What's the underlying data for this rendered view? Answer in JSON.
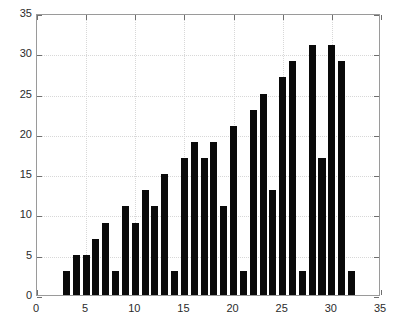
{
  "chart_data": {
    "type": "bar",
    "title": "",
    "subtitle": "",
    "xlabel": "",
    "ylabel": "",
    "grid": true,
    "legend": null,
    "legend_position": "none",
    "bar_color": "#0a0a0a",
    "axis_color": "#9a9a9a",
    "grid_color": "#d8d8d8",
    "background": "#ffffff",
    "xlim": [
      0,
      35
    ],
    "ylim": [
      0,
      35
    ],
    "xticks": [
      0,
      5,
      10,
      15,
      20,
      25,
      30,
      35
    ],
    "yticks": [
      0,
      5,
      10,
      15,
      20,
      25,
      30,
      35
    ],
    "xtick_labels": [
      "0",
      "5",
      "10",
      "15",
      "20",
      "25",
      "30",
      "35"
    ],
    "ytick_labels": [
      "0",
      "5",
      "10",
      "15",
      "20",
      "25",
      "30",
      "35"
    ],
    "bar_width": 0.72,
    "x": [
      3,
      4,
      5,
      6,
      7,
      8,
      9,
      10,
      11,
      12,
      13,
      14,
      15,
      16,
      17,
      18,
      19,
      20,
      21,
      22,
      23,
      24,
      25,
      26,
      27,
      28,
      29,
      30,
      31,
      32
    ],
    "values": [
      3,
      5,
      5,
      7,
      9,
      3,
      11,
      9,
      13,
      11,
      15,
      3,
      17,
      19,
      17,
      19,
      11,
      21,
      3,
      23,
      25,
      13,
      27,
      29,
      3,
      31,
      17,
      31,
      29,
      3
    ],
    "categories": [
      "3",
      "4",
      "5",
      "6",
      "7",
      "8",
      "9",
      "10",
      "11",
      "12",
      "13",
      "14",
      "15",
      "16",
      "17",
      "18",
      "19",
      "20",
      "21",
      "22",
      "23",
      "24",
      "25",
      "26",
      "27",
      "28",
      "29",
      "30",
      "31",
      "32"
    ],
    "annotations": []
  }
}
